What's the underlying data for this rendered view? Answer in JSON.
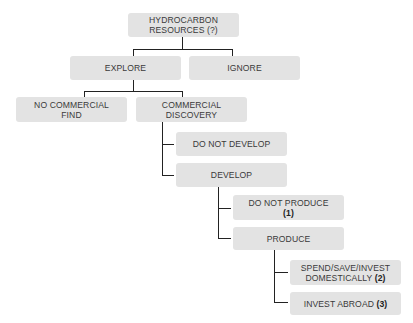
{
  "diagram": {
    "type": "decision-tree",
    "nodes": {
      "root": {
        "line1": "HYDROCARBON",
        "line2": "RESOURCES (?)"
      },
      "explore": {
        "label": "EXPLORE"
      },
      "ignore": {
        "label": "IGNORE"
      },
      "no_find": {
        "line1": "NO COMMERCIAL",
        "line2": "FIND"
      },
      "discovery": {
        "line1": "COMMERCIAL",
        "line2": "DISCOVERY"
      },
      "not_develop": {
        "label": "DO NOT DEVELOP"
      },
      "develop": {
        "label": "DEVELOP"
      },
      "not_produce": {
        "line1": "DO NOT PRODUCE",
        "note": "(1)"
      },
      "produce": {
        "label": "PRODUCE"
      },
      "spend": {
        "line1": "SPEND/SAVE/INVEST",
        "line2": "DOMESTICALLY",
        "note": "(2)"
      },
      "abroad": {
        "line1": "INVEST ABROAD",
        "note": "(3)"
      }
    },
    "colors": {
      "box": "#e3e3e3",
      "text": "#3a3a3a",
      "line": "#222222"
    }
  }
}
